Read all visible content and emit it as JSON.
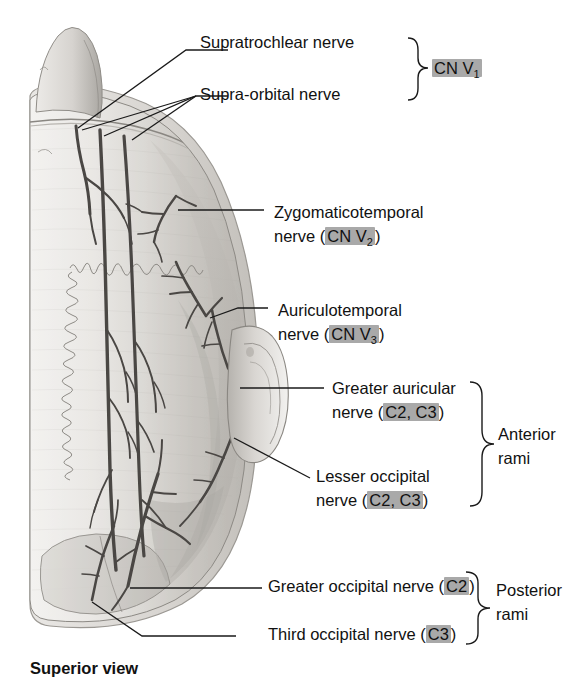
{
  "figure": {
    "caption": "Superior view",
    "view_type": "superior-view-head-scalp-innervation"
  },
  "labels": [
    {
      "id": "supratrochlear",
      "line1": "Supratrochlear nerve",
      "line2": "",
      "badge": "",
      "badge_pre": "",
      "badge_post": ""
    },
    {
      "id": "supraorbital",
      "line1": "Supra-orbital nerve",
      "line2": "",
      "badge": "",
      "badge_pre": "",
      "badge_post": ""
    },
    {
      "id": "zygomaticotemporal",
      "line1": "Zygomaticotemporal",
      "line2": "nerve ",
      "badge": "CN V2",
      "badge_pre": "(",
      "badge_post": ")"
    },
    {
      "id": "auriculotemporal",
      "line1": "Auriculotemporal",
      "line2": "nerve ",
      "badge": "CN V3",
      "badge_pre": "(",
      "badge_post": ")"
    },
    {
      "id": "greater-auricular",
      "line1": "Greater auricular",
      "line2": "nerve ",
      "badge": "C2, C3",
      "badge_pre": "(",
      "badge_post": ")"
    },
    {
      "id": "lesser-occipital",
      "line1": "Lesser occipital",
      "line2": "nerve ",
      "badge": "C2, C3",
      "badge_pre": "(",
      "badge_post": ")"
    },
    {
      "id": "greater-occipital",
      "line1": "Greater occipital nerve ",
      "line2": "",
      "badge": "C2",
      "badge_pre": "(",
      "badge_post": ")"
    },
    {
      "id": "third-occipital",
      "line1": "Third occipital nerve ",
      "line2": "",
      "badge": "C3",
      "badge_pre": "(",
      "badge_post": ")"
    }
  ],
  "text": {
    "supratrochlear": "Supratrochlear nerve",
    "supraorbital": "Supra-orbital nerve",
    "cn_v1": "CN V",
    "cn_v1_sub": "1",
    "zygo_l1": "Zygomaticotemporal",
    "zygo_l2_pre": "nerve (",
    "zygo_badge": "CN V",
    "zygo_badge_sub": "2",
    "zygo_l2_post": ")",
    "auri_l1": "Auriculotemporal",
    "auri_l2_pre": "nerve (",
    "auri_badge": "CN V",
    "auri_badge_sub": "3",
    "auri_l2_post": ")",
    "ga_l1": "Greater auricular",
    "ga_l2_pre": "nerve (",
    "ga_badge": "C2, C3",
    "ga_l2_post": ")",
    "lo_l1": "Lesser occipital",
    "lo_l2_pre": "nerve (",
    "lo_badge": "C2, C3",
    "lo_l2_post": ")",
    "go_pre": "Greater occipital nerve (",
    "go_badge": "C2",
    "go_post": ")",
    "to_pre": "Third occipital nerve (",
    "to_badge": "C3",
    "to_post": ")",
    "anterior_rami_l1": "Anterior",
    "anterior_rami_l2": "rami",
    "posterior_rami_l1": "Posterior",
    "posterior_rami_l2": "rami",
    "caption": "Superior view"
  },
  "groups": [
    {
      "id": "cn-v1-brace",
      "label": "CN V1",
      "members": [
        "supratrochlear",
        "supraorbital"
      ]
    },
    {
      "id": "anterior-rami-brace",
      "label": "Anterior rami",
      "members": [
        "greater-auricular",
        "lesser-occipital"
      ]
    },
    {
      "id": "posterior-rami-brace",
      "label": "Posterior rami",
      "members": [
        "greater-occipital",
        "third-occipital"
      ]
    }
  ],
  "colors": {
    "background": "#ffffff",
    "badge_gray": "#a9a9a9",
    "text": "#111111",
    "leader_line": "#1a1a1a",
    "scalp_light": "#efeeec",
    "scalp_mid": "#cfcdc9",
    "scalp_dark": "#b4b1ac",
    "nerve": "#4a4744",
    "outline": "#6e6b67"
  }
}
